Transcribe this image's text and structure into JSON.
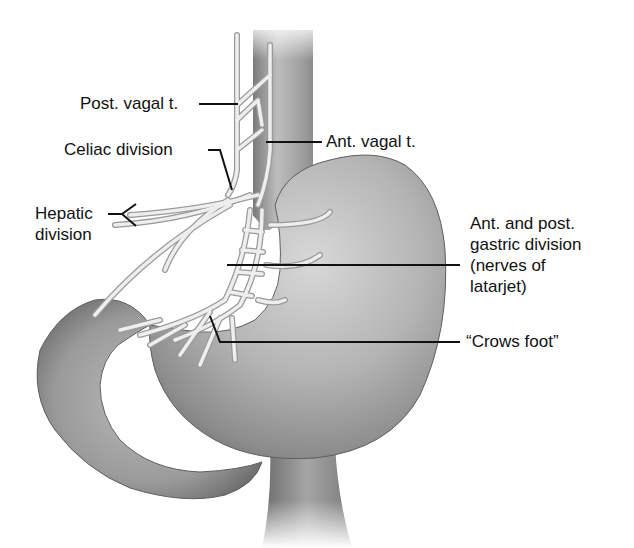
{
  "figure": {
    "colors": {
      "background": "#ffffff",
      "stomach_light": "#d9d9d9",
      "stomach_mid": "#a9a9a9",
      "stomach_dark": "#6e6e6e",
      "nerve_fill": "#ececec",
      "nerve_outline": "#9a9a9a",
      "leader_line": "#111111",
      "label_text": "#111111"
    }
  },
  "labels": {
    "post_vagal": "Post. vagal t.",
    "ant_vagal": "Ant. vagal t.",
    "celiac": "Celiac division",
    "hepatic_line1": "Hepatic",
    "hepatic_line2": "division",
    "gastric_line1": "Ant. and post.",
    "gastric_line2": "gastric division",
    "gastric_line3": "(nerves of",
    "gastric_line4": "latarjet)",
    "crows_foot": "“Crows foot”"
  },
  "structures": [
    "esophagus",
    "stomach",
    "duodenum",
    "posterior vagal trunk",
    "anterior vagal trunk",
    "celiac branch",
    "hepatic branch",
    "gastric branches",
    "crows foot terminal branches"
  ]
}
